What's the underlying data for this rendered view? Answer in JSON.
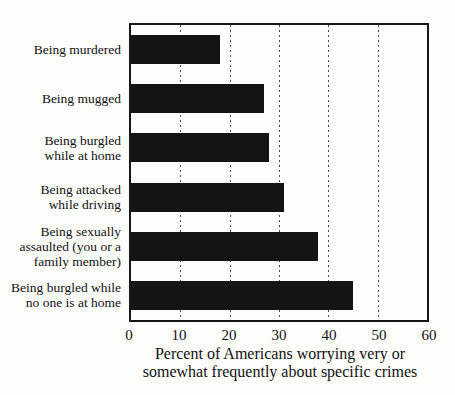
{
  "chart_data": {
    "type": "bar",
    "orientation": "horizontal",
    "title": "",
    "xlabel_lines": [
      "Percent of Americans worrying very or",
      "somewhat frequently about specific crimes"
    ],
    "ylabel": "",
    "categories": [
      "Being murdered",
      "Being mugged",
      "Being burgled while at home",
      "Being attacked while driving",
      "Being sexually assaulted (you or a family member)",
      "Being burgled while no one is at home"
    ],
    "category_label_lines": [
      [
        "Being murdered"
      ],
      [
        "Being mugged"
      ],
      [
        "Being burgled",
        "while at home"
      ],
      [
        "Being attacked",
        "while driving"
      ],
      [
        "Being sexually",
        "assaulted (you or a",
        "family member)"
      ],
      [
        "Being burgled while",
        "no one is at home"
      ]
    ],
    "values": [
      18,
      27,
      28,
      31,
      38,
      45
    ],
    "xlim": [
      0,
      60
    ],
    "xticks": [
      0,
      10,
      20,
      30,
      40,
      50,
      60
    ],
    "grid": "vertical dotted lines at interior x ticks",
    "legend": "none",
    "bar_color": "#141414",
    "frame_color": "#161616",
    "background_color": "#fdfdfc"
  }
}
